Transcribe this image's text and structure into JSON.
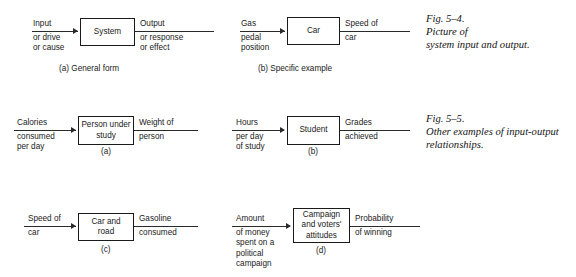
{
  "page": {
    "background": "#ffffff",
    "ink": "#1a1a1a"
  },
  "figures": [
    {
      "id": "fig-5-4",
      "caption": "Fig. 5–4.\nPicture of\nsystem input and output.",
      "diagrams": [
        {
          "id": "general-form",
          "input_above": "Input",
          "input_below": "or drive\nor cause",
          "box": "System",
          "output_above": "Output",
          "output_below": "or response\nor effect",
          "part_caption": "(a) General form"
        },
        {
          "id": "specific-example",
          "input_above": "Gas",
          "input_below": "pedal\nposition",
          "box": "Car",
          "output_above": "Speed of",
          "output_below": "car",
          "part_caption": "(b) Specific example"
        }
      ]
    },
    {
      "id": "fig-5-5",
      "caption": "Fig. 5–5.\nOther examples of input-output\nrelationships.",
      "diagrams": [
        {
          "id": "person-under-study",
          "input_above": "Calories",
          "input_below": "consumed\nper day",
          "box": "Person under\nstudy",
          "output_above": "Weight of",
          "output_below": "person",
          "part_caption": "(a)"
        },
        {
          "id": "student",
          "input_above": "Hours",
          "input_below": "per day\nof study",
          "box": "Student",
          "output_above": "Grades",
          "output_below": "achieved",
          "part_caption": "(b)"
        },
        {
          "id": "car-and-road",
          "input_above": "Speed of",
          "input_below": "car",
          "box": "Car and\nroad",
          "output_above": "Gasoline",
          "output_below": "consumed",
          "part_caption": "(c)"
        },
        {
          "id": "campaign",
          "input_above": "Amount",
          "input_below": "of money\nspent on a\npolitical\ncampaign",
          "box": "Campaign\nand voters'\nattitudes",
          "output_above": "Probability",
          "output_below": "of winning",
          "part_caption": "(d)"
        }
      ]
    }
  ]
}
